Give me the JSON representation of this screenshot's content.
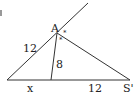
{
  "diagram": {
    "type": "geometry-triangle",
    "points": {
      "A": {
        "label": "A",
        "x": 57,
        "y": 33
      },
      "S_prime": {
        "label": "S'",
        "x": 130,
        "y": 80
      },
      "left": {
        "x": 7,
        "y": 80
      },
      "foot": {
        "x": 51,
        "y": 80
      },
      "ray_end": {
        "x": 88,
        "y": 3
      }
    },
    "labels": {
      "vertex_a": "A",
      "vertex_s_prime": "S'",
      "left_side": "12",
      "bisector": "8",
      "base_left": "x",
      "base_right": "12",
      "angle_mark_1": "*",
      "angle_mark_2": "*"
    },
    "stroke_color": "#333333"
  }
}
